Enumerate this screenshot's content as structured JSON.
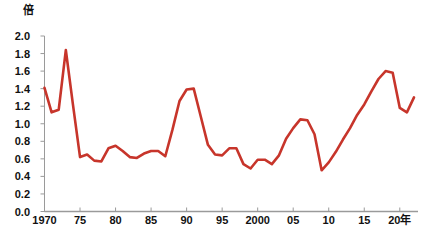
{
  "chart_data": {
    "type": "line",
    "title": "",
    "subtitle": "",
    "xlabel": "",
    "ylabel": "倍",
    "unit_label": "倍",
    "xlim": [
      1970,
      2022
    ],
    "ylim": [
      0.0,
      2.0
    ],
    "grid": false,
    "legend": "none",
    "line_color": "#C7352B",
    "axis_color": "#9a9a9a",
    "text_color": "#111111",
    "ytick_values": [
      0.0,
      0.2,
      0.4,
      0.6,
      0.8,
      1.0,
      1.2,
      1.4,
      1.6,
      1.8,
      2.0
    ],
    "ytick_labels": [
      "0.0",
      "0.2",
      "0.4",
      "0.6",
      "0.8",
      "1.0",
      "1.2",
      "1.4",
      "1.6",
      "1.8",
      "2.0"
    ],
    "xtick_values": [
      1970,
      1975,
      1980,
      1985,
      1990,
      1995,
      2000,
      2005,
      2010,
      2015,
      2020
    ],
    "xtick_labels": [
      "1970",
      "75",
      "80",
      "85",
      "90",
      "95",
      "2000",
      "05",
      "10",
      "15",
      "20年"
    ],
    "x": [
      1970,
      1971,
      1972,
      1973,
      1974,
      1975,
      1976,
      1977,
      1978,
      1979,
      1980,
      1981,
      1982,
      1983,
      1984,
      1985,
      1986,
      1987,
      1988,
      1989,
      1990,
      1991,
      1992,
      1993,
      1994,
      1995,
      1996,
      1997,
      1998,
      1999,
      2000,
      2001,
      2002,
      2003,
      2004,
      2005,
      2006,
      2007,
      2008,
      2009,
      2010,
      2011,
      2012,
      2013,
      2014,
      2015,
      2016,
      2017,
      2018,
      2019,
      2020,
      2021,
      2022
    ],
    "series": [
      {
        "name": "有効求人倍率",
        "values": [
          1.41,
          1.13,
          1.16,
          1.84,
          1.22,
          0.62,
          0.65,
          0.58,
          0.57,
          0.72,
          0.75,
          0.69,
          0.62,
          0.61,
          0.66,
          0.69,
          0.69,
          0.63,
          0.93,
          1.26,
          1.39,
          1.4,
          1.08,
          0.76,
          0.65,
          0.64,
          0.72,
          0.72,
          0.54,
          0.49,
          0.59,
          0.59,
          0.54,
          0.64,
          0.83,
          0.95,
          1.05,
          1.04,
          0.88,
          0.47,
          0.56,
          0.68,
          0.82,
          0.95,
          1.1,
          1.22,
          1.37,
          1.51,
          1.6,
          1.58,
          1.18,
          1.13,
          1.3
        ]
      }
    ],
    "annotations": []
  }
}
